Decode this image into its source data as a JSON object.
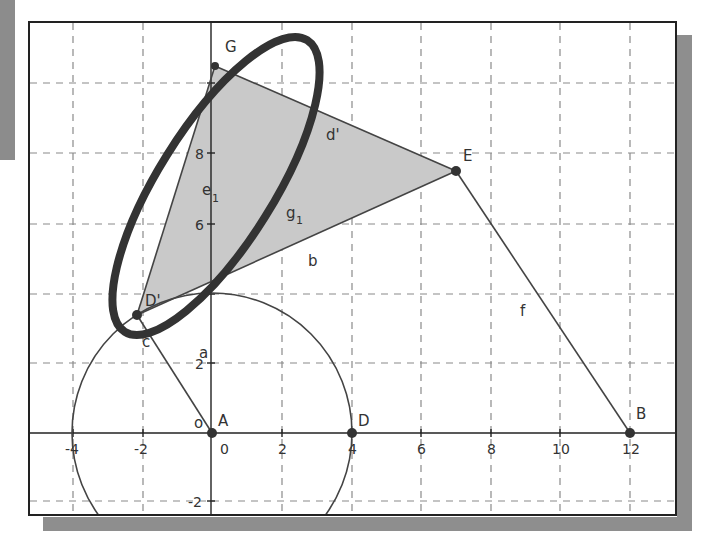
{
  "figure": {
    "type": "geometry-construction",
    "x_ticks": [
      "-4",
      "-2",
      "0",
      "2",
      "4",
      "6",
      "8",
      "10",
      "12"
    ],
    "y_ticks": [
      "-2",
      "2",
      "6",
      "8"
    ],
    "points": {
      "A": {
        "label": "A",
        "x": 0,
        "y": 0
      },
      "B": {
        "label": "B",
        "x": 12,
        "y": 0
      },
      "D": {
        "label": "D",
        "x": 4,
        "y": 0
      },
      "E": {
        "label": "E",
        "x": 7,
        "y": 7.5
      },
      "G": {
        "label": "G",
        "x": 0.1,
        "y": 10.5
      },
      "D_prime": {
        "label": "D'",
        "x": -2.2,
        "y": 3.4
      }
    },
    "labels": {
      "d_prime": "d'",
      "e": "e",
      "e_sub": "1",
      "g": "g",
      "g_sub": "1",
      "b": "b",
      "f": "f",
      "a": "a",
      "c": "c",
      "o": "o"
    },
    "colors": {
      "shade": "#c8c8c8",
      "ellipse": "#333333",
      "lines": "#444444",
      "grid": "#888888"
    }
  }
}
